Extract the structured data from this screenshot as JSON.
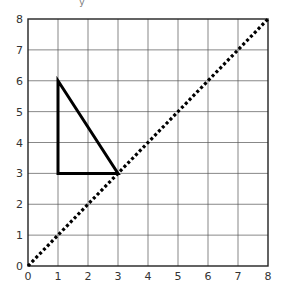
{
  "chart_data": {
    "type": "line",
    "title": "",
    "xlabel": "",
    "ylabel": "y",
    "xlim": [
      0,
      8
    ],
    "ylim": [
      0,
      8
    ],
    "grid": true,
    "x_ticks": [
      "0",
      "1",
      "2",
      "3",
      "4",
      "5",
      "6",
      "7",
      "8"
    ],
    "y_ticks": [
      "0",
      "1",
      "2",
      "3",
      "4",
      "5",
      "6",
      "7",
      "8"
    ],
    "series": [
      {
        "name": "triangle",
        "style": "solid",
        "color": "#000000",
        "closed": true,
        "points": [
          [
            1,
            6
          ],
          [
            1,
            3
          ],
          [
            3,
            3
          ]
        ]
      },
      {
        "name": "line y = x",
        "style": "dotted",
        "color": "#000000",
        "closed": false,
        "points": [
          [
            0,
            0
          ],
          [
            8,
            8
          ]
        ]
      }
    ]
  }
}
